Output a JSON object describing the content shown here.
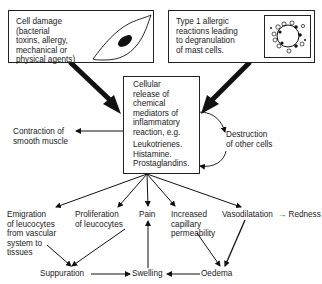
{
  "top_left_box": {
    "lines": [
      "Cell damage",
      "(bacterial",
      "toxins, allergy,",
      "mechanical or",
      "physical agents)"
    ],
    "icon": "cell-with-nucleus-icon"
  },
  "top_right_box": {
    "lines": [
      "Type 1 allergic",
      "reactions leading",
      "to degranulation",
      "of mast cells."
    ],
    "icon": "degranulating-mast-cell-icon"
  },
  "center_box": {
    "lines": [
      "Cellular",
      "release of",
      "chemical",
      "mediators of",
      "inflammatory",
      "reaction, e.g."
    ],
    "examples": [
      "Leukotrienes.",
      "Histamine.",
      "Prostaglandins."
    ]
  },
  "side_effects": {
    "left": [
      "Contraction of",
      "smooth muscle"
    ],
    "right": [
      "Destruction",
      "of other cells"
    ]
  },
  "effects": [
    {
      "lines": [
        "Emigration",
        "of leucocytes",
        "from vascular",
        "system to",
        "tissues"
      ]
    },
    {
      "lines": [
        "Proliferation",
        "of leucocytes"
      ]
    },
    {
      "lines": [
        "Pain"
      ]
    },
    {
      "lines": [
        "Increased",
        "capillary",
        "permeability"
      ]
    },
    {
      "lines": [
        "Vasodilatation"
      ]
    }
  ],
  "redness": "→ Redness",
  "outcomes": {
    "suppuration": "Suppuration",
    "swelling": "Swelling",
    "oedema": "Oedema"
  }
}
